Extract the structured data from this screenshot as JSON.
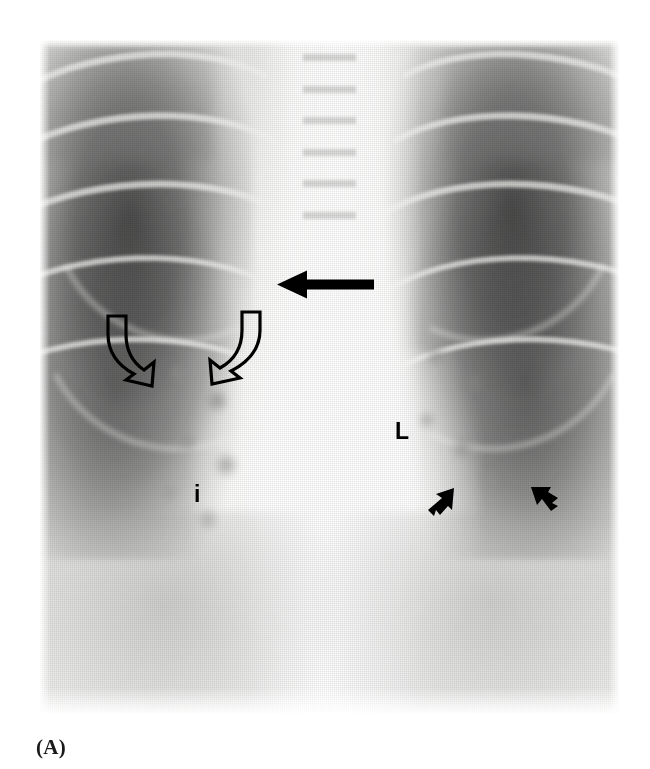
{
  "figure": {
    "caption": "(A)",
    "modality": "chest-radiograph",
    "view": "posteroanterior",
    "background_color": "#ffffff",
    "annotation_color": "#000000",
    "plate": {
      "left": 40,
      "top": 40,
      "width": 579,
      "height": 674
    }
  },
  "annotations": {
    "solid_arrow": {
      "name": "right-paratracheal-arrow",
      "label": "solid black arrow",
      "direction": "left",
      "x": 277,
      "y": 272,
      "width": 96,
      "height": 26
    },
    "open_arrows": [
      {
        "name": "open-arrow-lateral",
        "label": "open curved arrow",
        "direction": "down-right",
        "x": 98,
        "y": 316,
        "width": 68,
        "height": 74
      },
      {
        "name": "open-arrow-medial",
        "label": "open curved arrow",
        "direction": "down-left",
        "x": 200,
        "y": 312,
        "width": 68,
        "height": 76
      }
    ],
    "small_arrows": [
      {
        "name": "small-arrow-medial",
        "label": "small solid arrow",
        "direction": "up-right",
        "x": 427,
        "y": 487,
        "width": 28,
        "height": 30
      },
      {
        "name": "small-arrow-lateral",
        "label": "small solid arrow",
        "direction": "up-left",
        "x": 528,
        "y": 484,
        "width": 30,
        "height": 30
      }
    ],
    "letters": [
      {
        "name": "marker-L",
        "text": "L",
        "x": 395,
        "y": 420
      },
      {
        "name": "marker-i",
        "text": "i",
        "x": 194,
        "y": 483
      }
    ]
  }
}
